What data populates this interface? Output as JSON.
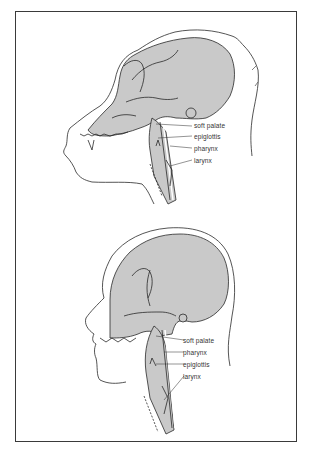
{
  "figure": {
    "top_panel": {
      "subject": "ape head cross-section",
      "labels": [
        "soft palate",
        "epiglottis",
        "pharynx",
        "larynx"
      ]
    },
    "bottom_panel": {
      "subject": "human head cross-section",
      "labels": [
        "soft palate",
        "pharynx",
        "epiglottis",
        "larynx"
      ]
    },
    "colors": {
      "fill": "#c9c9c9",
      "stroke": "#2a2a2a",
      "frame": "#3a3a3a",
      "background": "#ffffff"
    }
  }
}
